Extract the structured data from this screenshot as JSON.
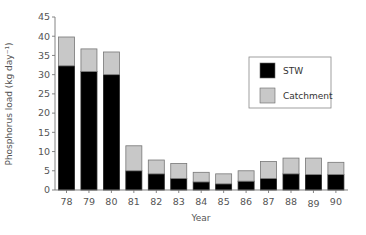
{
  "chart_data": {
    "type": "bar",
    "stacked": true,
    "title": "",
    "xlabel": "Year",
    "ylabel": "Phosphorus load (kg day⁻¹)",
    "ylim": [
      0,
      45
    ],
    "yticks": [
      0,
      5,
      10,
      15,
      20,
      25,
      30,
      35,
      40,
      45
    ],
    "grid": false,
    "legend_position": "upper right (inside)",
    "categories": [
      "78",
      "79",
      "80",
      "81",
      "82",
      "83",
      "84",
      "85",
      "86",
      "87",
      "88",
      "89",
      "90"
    ],
    "series": [
      {
        "name": "STW",
        "color": "#000000",
        "values": [
          32.3,
          30.8,
          30.0,
          5.0,
          4.2,
          3.0,
          2.1,
          1.6,
          2.3,
          3.0,
          4.2,
          4.0,
          4.0
        ]
      },
      {
        "name": "Catchment",
        "color": "#c8c8c8",
        "values": [
          7.5,
          5.9,
          5.9,
          6.5,
          3.6,
          3.9,
          2.5,
          2.6,
          2.7,
          4.4,
          4.1,
          4.3,
          3.2
        ]
      }
    ],
    "totals": [
      39.8,
      36.7,
      35.9,
      11.5,
      7.8,
      6.9,
      4.6,
      4.2,
      5.0,
      7.4,
      8.3,
      8.3,
      7.2
    ]
  },
  "legend": {
    "items": [
      {
        "label": "STW",
        "color": "#000000"
      },
      {
        "label": "Catchment",
        "color": "#c8c8c8"
      }
    ]
  },
  "axes": {
    "x_title": "Year",
    "y_title": "Phosphorus load (kg day⁻¹)"
  }
}
